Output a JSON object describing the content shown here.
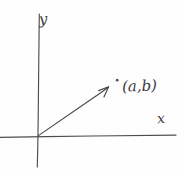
{
  "figure": {
    "background_color": "#fefefe",
    "ink_color": "#3b3b3b"
  },
  "axes": {
    "y_label": "y",
    "x_label": "x",
    "origin": {
      "x": 38,
      "y": 136
    },
    "x_axis": {
      "x1": 0,
      "y1": 137,
      "x2": 176,
      "y2": 135
    },
    "y_axis": {
      "x1": 39,
      "y1": 14,
      "x2": 37,
      "y2": 167
    }
  },
  "vector": {
    "from": {
      "x": 38,
      "y": 136
    },
    "to": {
      "x": 108,
      "y": 87
    },
    "has_arrowhead": true
  },
  "point": {
    "marker_label": "point-dot",
    "marker": {
      "x": 117,
      "y": 80
    },
    "label": "(a,b)"
  }
}
